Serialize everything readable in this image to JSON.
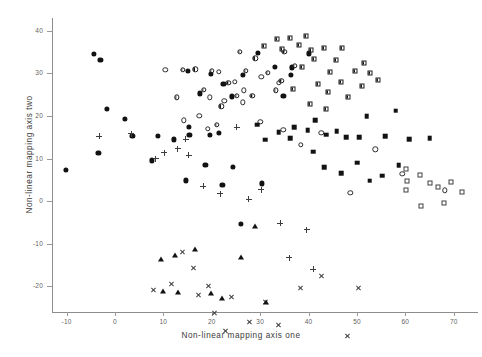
{
  "chart_data": {
    "type": "scatter",
    "title": "",
    "xlabel": "Non-linear mapping axis one",
    "ylabel": "Non-linear mapping axis two",
    "xlim": [
      -13,
      75
    ],
    "ylim": [
      -26,
      43
    ],
    "xticks": [
      -10,
      0,
      10,
      20,
      30,
      40,
      50,
      60,
      70
    ],
    "yticks": [
      40,
      30,
      20,
      10,
      0,
      -10,
      -20
    ],
    "xticklabels": [
      "-10",
      "0",
      "10",
      "20",
      "30",
      "40",
      "50",
      "60",
      "70"
    ],
    "yticklabels": [
      "40",
      "30",
      "20",
      "10",
      "0",
      "-10",
      "-20"
    ],
    "grid": false,
    "legend": "none",
    "series": [
      {
        "name": "filled-circle",
        "marker": "filled-circle",
        "points": [
          [
            -10.2,
            7.4
          ],
          [
            -3.4,
            11.3
          ],
          [
            -1.6,
            21.7
          ],
          [
            2.0,
            19.4
          ],
          [
            3.6,
            15.4
          ],
          [
            7.6,
            9.6
          ],
          [
            8.9,
            15.3
          ],
          [
            12.2,
            14.5
          ],
          [
            15.4,
            15.5
          ],
          [
            15.2,
            17.5
          ],
          [
            18.7,
            8.6
          ],
          [
            19.6,
            15.5
          ],
          [
            24.4,
            8.1
          ],
          [
            22.2,
            3.8
          ],
          [
            26.0,
            -5.4
          ],
          [
            14.6,
            4.9
          ],
          [
            21.4,
            16.1
          ],
          [
            17.6,
            25.3
          ],
          [
            19.8,
            29.8
          ],
          [
            15.0,
            30.6
          ],
          [
            22.4,
            27.6
          ],
          [
            24.2,
            24.6
          ],
          [
            26.5,
            29.7
          ],
          [
            29.6,
            34.8
          ],
          [
            33.0,
            31.5
          ],
          [
            36.6,
            31.4
          ],
          [
            36.4,
            29.6
          ],
          [
            34.8,
            24.8
          ],
          [
            40.0,
            34.7
          ],
          [
            -4.4,
            34.6
          ],
          [
            -3.0,
            33.1
          ],
          [
            30.4,
            4.2
          ]
        ]
      },
      {
        "name": "half-filled-circle",
        "marker": "half-circle",
        "points": [
          [
            16.6,
            31.0
          ],
          [
            20.0,
            30.6
          ],
          [
            23.4,
            27.8
          ],
          [
            25.2,
            24.8
          ],
          [
            27.0,
            30.6
          ],
          [
            29.0,
            33.5
          ],
          [
            31.6,
            30.2
          ],
          [
            33.2,
            26.0
          ],
          [
            28.4,
            24.7
          ],
          [
            22.0,
            22.3
          ],
          [
            18.4,
            26.2
          ],
          [
            21.0,
            18.0
          ],
          [
            14.0,
            30.8
          ],
          [
            25.8,
            35.0
          ],
          [
            35.0,
            35.0
          ],
          [
            37.2,
            31.8
          ],
          [
            34.4,
            28.2
          ],
          [
            12.8,
            24.4
          ]
        ]
      },
      {
        "name": "open-circle",
        "marker": "open-circle",
        "points": [
          [
            10.4,
            30.8
          ],
          [
            21.4,
            30.4
          ],
          [
            24.8,
            28.0
          ],
          [
            26.6,
            26.0
          ],
          [
            19.6,
            24.4
          ],
          [
            22.6,
            23.6
          ],
          [
            26.4,
            23.2
          ],
          [
            19.2,
            17.0
          ],
          [
            30.0,
            18.6
          ],
          [
            34.8,
            16.8
          ],
          [
            38.4,
            13.2
          ],
          [
            42.6,
            16.0
          ],
          [
            53.8,
            12.2
          ],
          [
            59.4,
            6.4
          ],
          [
            30.2,
            29.2
          ],
          [
            33.8,
            27.8
          ],
          [
            17.4,
            20.0
          ],
          [
            14.2,
            19.0
          ],
          [
            68.2,
            2.6
          ],
          [
            48.6,
            2.0
          ]
        ]
      },
      {
        "name": "plus",
        "marker": "plus",
        "points": [
          [
            -3.2,
            15.3
          ],
          [
            3.4,
            17.2
          ],
          [
            8.4,
            12.8
          ],
          [
            10.2,
            15.6
          ],
          [
            13.0,
            18.0
          ],
          [
            14.6,
            21.6
          ],
          [
            15.2,
            19.2
          ],
          [
            18.2,
            13.4
          ],
          [
            21.8,
            13.0
          ],
          [
            25.2,
            30.0
          ],
          [
            27.6,
            14.6
          ],
          [
            30.2,
            18.2
          ],
          [
            34.2,
            11.8
          ],
          [
            36.0,
            5.0
          ],
          [
            39.6,
            13.0
          ],
          [
            41.0,
            5.2
          ]
        ]
      },
      {
        "name": "cross",
        "marker": "cross",
        "points": [
          [
            8.0,
            1.6
          ],
          [
            11.6,
            4.5
          ],
          [
            14.0,
            13.4
          ],
          [
            16.2,
            11.0
          ],
          [
            17.2,
            6.2
          ],
          [
            19.4,
            9.6
          ],
          [
            20.6,
            4.8
          ],
          [
            22.8,
            2.0
          ],
          [
            24.0,
            11.2
          ],
          [
            27.8,
            6.8
          ],
          [
            31.0,
            13.0
          ],
          [
            33.8,
            9.0
          ],
          [
            38.4,
            19.0
          ],
          [
            42.6,
            23.2
          ],
          [
            48.0,
            10.6
          ],
          [
            50.2,
            23.4
          ],
          [
            56.8,
            -3.6
          ],
          [
            45.2,
            8.2
          ],
          [
            39.6,
            9.4
          ]
        ]
      },
      {
        "name": "half-filled-square",
        "marker": "half-square",
        "points": [
          [
            34.6,
            35.8
          ],
          [
            36.2,
            38.2
          ],
          [
            38.0,
            36.6
          ],
          [
            39.4,
            38.8
          ],
          [
            40.6,
            35.6
          ],
          [
            41.2,
            33.4
          ],
          [
            43.2,
            36.0
          ],
          [
            44.4,
            30.4
          ],
          [
            45.6,
            33.2
          ],
          [
            47.0,
            35.9
          ],
          [
            49.6,
            30.5
          ],
          [
            51.4,
            32.5
          ],
          [
            52.6,
            30.1
          ],
          [
            38.6,
            31.6
          ],
          [
            42.0,
            27.6
          ],
          [
            44.0,
            25.6
          ],
          [
            46.8,
            28.0
          ],
          [
            36.8,
            26.4
          ],
          [
            40.2,
            22.8
          ],
          [
            43.6,
            21.6
          ],
          [
            48.2,
            24.4
          ],
          [
            51.0,
            27.0
          ],
          [
            54.4,
            28.4
          ],
          [
            33.4,
            38.0
          ],
          [
            30.8,
            36.4
          ]
        ]
      },
      {
        "name": "filled-square",
        "marker": "filled-square",
        "points": [
          [
            37.0,
            17.4
          ],
          [
            39.8,
            16.6
          ],
          [
            41.4,
            19.0
          ],
          [
            43.6,
            15.6
          ],
          [
            45.8,
            16.4
          ],
          [
            47.8,
            15.0
          ],
          [
            50.4,
            15.0
          ],
          [
            52.0,
            20.0
          ],
          [
            55.8,
            15.2
          ],
          [
            58.0,
            21.2
          ],
          [
            60.8,
            14.6
          ],
          [
            65.0,
            14.8
          ],
          [
            36.2,
            14.8
          ],
          [
            33.8,
            16.2
          ],
          [
            31.0,
            14.4
          ],
          [
            29.4,
            18.0
          ],
          [
            43.2,
            8.0
          ],
          [
            46.8,
            6.6
          ],
          [
            50.0,
            9.0
          ],
          [
            52.6,
            4.8
          ],
          [
            55.2,
            6.0
          ],
          [
            58.6,
            8.4
          ],
          [
            41.0,
            11.6
          ]
        ]
      },
      {
        "name": "open-square",
        "marker": "open-square",
        "points": [
          [
            60.2,
            7.6
          ],
          [
            60.4,
            4.8
          ],
          [
            60.2,
            2.6
          ],
          [
            63.0,
            6.2
          ],
          [
            65.0,
            4.2
          ],
          [
            66.8,
            3.4
          ],
          [
            69.4,
            4.4
          ],
          [
            71.6,
            2.2
          ],
          [
            68.0,
            -0.4
          ],
          [
            63.2,
            -1.2
          ]
        ]
      },
      {
        "name": "open-triangle",
        "marker": "open-triangle",
        "points": [
          [
            -9.4,
            -9.2
          ],
          [
            -5.0,
            -6.2
          ],
          [
            -1.2,
            -6.6
          ],
          [
            1.4,
            -8.4
          ],
          [
            -7.4,
            -10.6
          ]
        ]
      },
      {
        "name": "filled-triangle",
        "marker": "filled-triangle",
        "points": [
          [
            9.6,
            -13.6
          ],
          [
            12.4,
            -12.6
          ],
          [
            16.6,
            -11.2
          ],
          [
            10.0,
            -21.0
          ],
          [
            13.0,
            -21.2
          ],
          [
            22.2,
            -22.8
          ],
          [
            19.8,
            -21.6
          ],
          [
            29.0,
            -5.8
          ],
          [
            26.0,
            -13.0
          ],
          [
            31.2,
            -23.6
          ]
        ]
      },
      {
        "name": "open-down-triangle",
        "marker": "open-down-triangle",
        "points": [
          [
            13.6,
            -23.6
          ],
          [
            18.4,
            -23.2
          ]
        ]
      }
    ]
  }
}
